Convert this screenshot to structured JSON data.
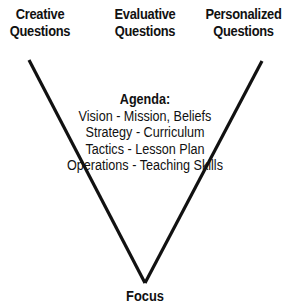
{
  "headers": [
    {
      "line1": "Creative",
      "line2": "Questions"
    },
    {
      "line1": "Evaluative",
      "line2": "Questions"
    },
    {
      "line1": "Personalized",
      "line2": "Questions"
    }
  ],
  "agenda": {
    "title": "Agenda:",
    "items": [
      "Vision - Mission, Beliefs",
      "Strategy - Curriculum",
      "Tactics - Lesson Plan",
      "Operations - Teaching Skills"
    ]
  },
  "focus_label": "Focus",
  "colors": {
    "line": "#111111",
    "text": "#111111",
    "background": "#ffffff"
  }
}
